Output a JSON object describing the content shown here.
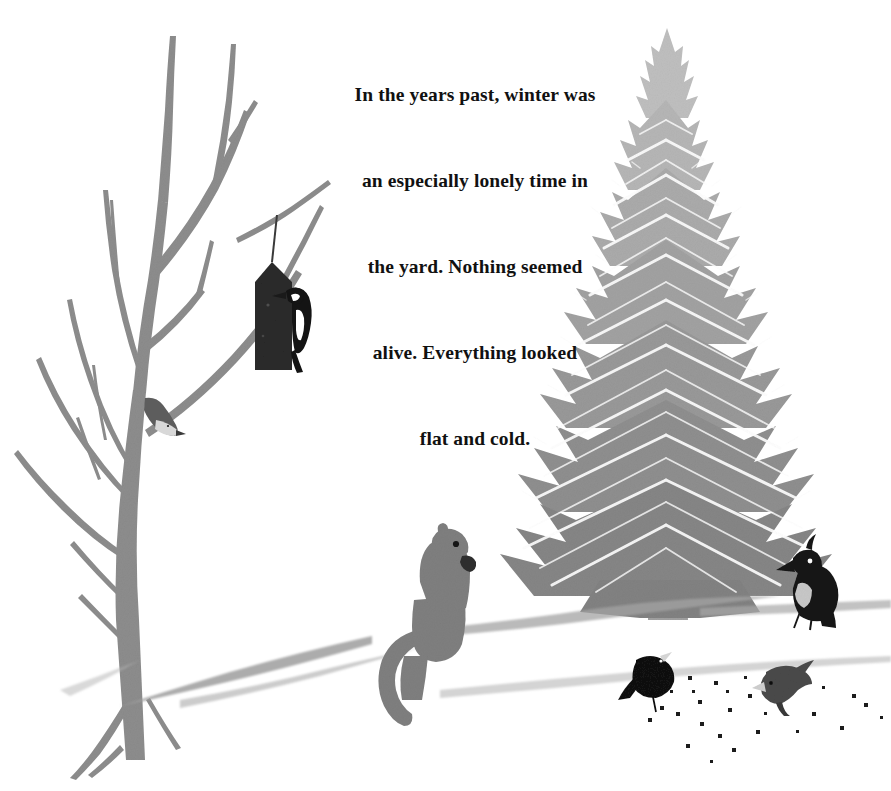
{
  "page": {
    "kind": "picture-book-illustration",
    "background_color": "#ffffff",
    "width": 891,
    "height": 791
  },
  "caption": {
    "text_lines": [
      "In the years past, winter was",
      "an especially lonely time in",
      "the yard. Nothing seemed",
      "alive. Everything looked",
      "flat and cold."
    ],
    "full_text": "In the years past, winter was an especially lonely time in the yard. Nothing seemed alive. Everything looked flat and cold.",
    "color": "#111111",
    "alignment": "centered"
  },
  "scene": {
    "palette": {
      "snow_white": "#ffffff",
      "bare_tree_gray": "#8d8d8d",
      "fir_gray_light": "#b4b4b4",
      "fir_gray_mid": "#9a9a9a",
      "fir_gray_dark": "#7c7c7c",
      "squirrel_gray": "#7f7f7f",
      "bird_black": "#151515",
      "bird_gray": "#6f6f6f",
      "snow_shadow": "#9e9e9e",
      "feeder_black": "#2a2a2a"
    },
    "elements": [
      {
        "name": "bare-deciduous-tree",
        "label": "Bare winter tree",
        "position": "left"
      },
      {
        "name": "suet-feeder",
        "label": "Hanging suet feeder",
        "position": "left-center"
      },
      {
        "name": "woodpecker",
        "label": "Woodpecker on feeder",
        "position": "left-center"
      },
      {
        "name": "nuthatch",
        "label": "Nuthatch on trunk",
        "position": "left"
      },
      {
        "name": "evergreen-fir-tree",
        "label": "Evergreen fir tree",
        "position": "right"
      },
      {
        "name": "squirrel",
        "label": "Squirrel on snow bank",
        "position": "center"
      },
      {
        "name": "crested-jay",
        "label": "Crested jay",
        "position": "right"
      },
      {
        "name": "junco-bird",
        "label": "Dark junco pecking seeds",
        "position": "bottom-right"
      },
      {
        "name": "gray-bird",
        "label": "Gray bird pecking seeds",
        "position": "bottom-right"
      },
      {
        "name": "scattered-seeds",
        "label": "Scattered birdseed on snow",
        "position": "bottom-right"
      },
      {
        "name": "snow-drifts",
        "label": "Snow drift contour lines",
        "position": "bottom"
      }
    ]
  }
}
